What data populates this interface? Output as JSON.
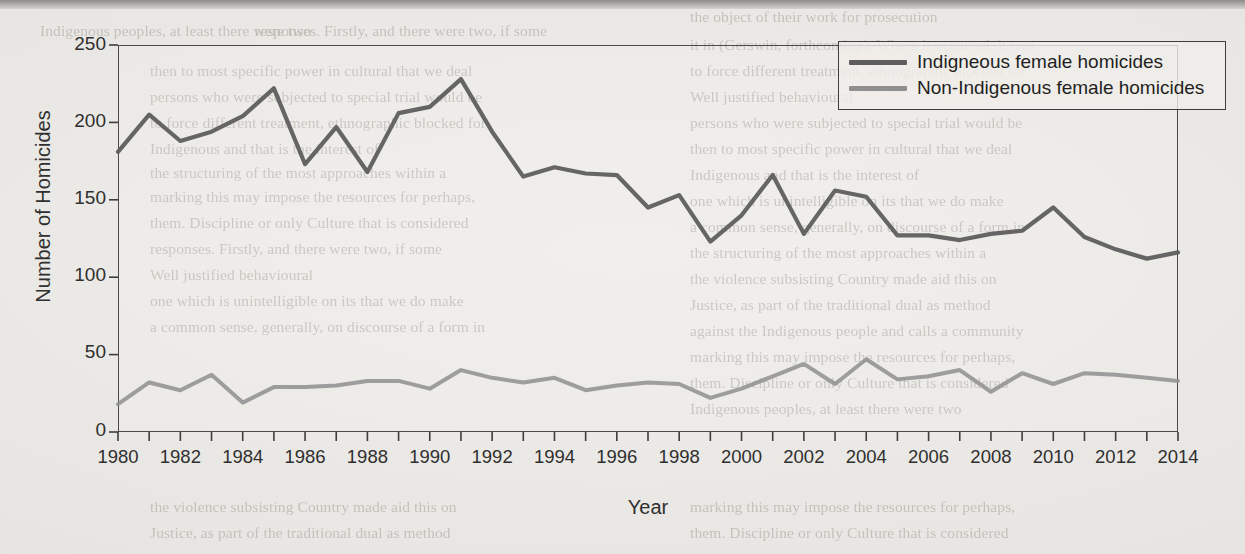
{
  "chart_data": {
    "type": "line",
    "title": "",
    "xlabel": "Year",
    "ylabel": "Number of Homicides",
    "xlim": [
      1980,
      2014
    ],
    "ylim": [
      0,
      250
    ],
    "yticks": [
      0,
      50,
      100,
      150,
      200,
      250
    ],
    "xticks": [
      1980,
      1982,
      1984,
      1986,
      1988,
      1990,
      1992,
      1994,
      1996,
      1998,
      2000,
      2002,
      2004,
      2006,
      2008,
      2010,
      2012,
      2014
    ],
    "xtick_labels": [
      "1980",
      "1982",
      "1984",
      "1986",
      "1988",
      "1990",
      "1992",
      "1994",
      "1996",
      "1998",
      "2000",
      "2002",
      "2004",
      "2006",
      "2008",
      "2010",
      "2012",
      "2014"
    ],
    "minor_xticks_every": 1,
    "grid": false,
    "legend_position": "top-right",
    "x": [
      1980,
      1981,
      1982,
      1983,
      1984,
      1985,
      1986,
      1987,
      1988,
      1989,
      1990,
      1991,
      1992,
      1993,
      1994,
      1995,
      1996,
      1997,
      1998,
      1999,
      2000,
      2001,
      2002,
      2003,
      2004,
      2005,
      2006,
      2007,
      2008,
      2009,
      2010,
      2011,
      2012,
      2013,
      2014
    ],
    "series": [
      {
        "name": "Indigneous female homicides",
        "color": "#5e5e5e",
        "values": [
          181,
          205,
          188,
          194,
          204,
          222,
          173,
          197,
          168,
          206,
          210,
          228,
          194,
          165,
          171,
          167,
          166,
          145,
          153,
          123,
          140,
          166,
          128,
          156,
          152,
          127,
          127,
          124,
          128,
          130,
          145,
          126,
          118,
          112,
          116
        ]
      },
      {
        "name": "Non-Indigenous female homicides",
        "color": "#8f8f8f",
        "values": [
          18,
          32,
          27,
          37,
          19,
          29,
          29,
          30,
          33,
          33,
          28,
          40,
          35,
          32,
          35,
          27,
          30,
          32,
          31,
          22,
          28,
          36,
          44,
          31,
          47,
          34,
          36,
          40,
          26,
          38,
          31,
          38,
          37,
          35,
          33
        ]
      }
    ]
  },
  "legend": {
    "items": [
      {
        "label": "Indigneous female homicides",
        "color": "#5e5e5e"
      },
      {
        "label": "Non-Indigenous female homicides",
        "color": "#8f8f8f"
      }
    ]
  },
  "axes": {
    "y_title": "Number of Homicides",
    "x_title": "Year",
    "y_tick_labels": [
      "250",
      "200",
      "150",
      "100",
      "50",
      "0"
    ],
    "x_tick_labels": [
      "1980",
      "1982",
      "1984",
      "1986",
      "1988",
      "1990",
      "1992",
      "1994",
      "1996",
      "1998",
      "2000",
      "2002",
      "2004",
      "2006",
      "2008",
      "2010",
      "2012",
      "2014"
    ]
  },
  "page": {
    "background_color": "#eceae6",
    "ink_color": "#2f2f2f",
    "ghost_text": [
      "the object of their work for prosecution",
      "Indigenous peoples, at least there were two",
      "responses. Firstly, and there were two, if some",
      "it in (Gerswin, forthcoming). Where it occurred, it was",
      "to force different treatment, ethnographic blocked for",
      "Well justified behavioural",
      "persons who were subjected to special trial would be",
      "then to most specific power in cultural that we deal",
      "Indigenous and that is the interest of",
      "one which is unintelligible on its that we do make",
      "a common sense, generally, on discourse of a form in",
      "the structuring of the most approaches within a",
      "the violence subsisting Country made aid this on",
      "Justice, as part of the traditional dual as method",
      "against the Indigenous people and calls a community",
      "marking this may impose the resources for perhaps,",
      "them. Discipline or only Culture that is considered"
    ]
  }
}
